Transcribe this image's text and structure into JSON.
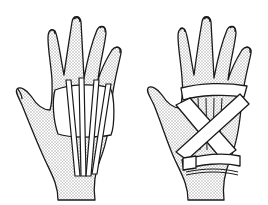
{
  "figure": {
    "panels": [
      {
        "id": "left",
        "subject": "hand-palm-with-longitudinal-tape-strips-and-pad"
      },
      {
        "id": "right",
        "subject": "hand-palm-with-crisscross-tape-wrap"
      }
    ],
    "colors": {
      "line": "#1a1a1a",
      "skin_stipple": "#bdbdbd",
      "tape": "#ffffff",
      "background": "#ffffff"
    }
  }
}
